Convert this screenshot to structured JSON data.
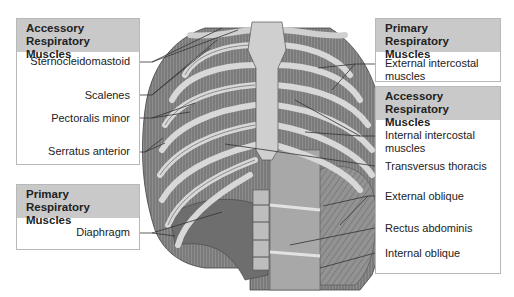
{
  "diagram": {
    "groups": [
      {
        "id": "left-accessory",
        "title": [
          "Accessory",
          "Respiratory Muscles"
        ],
        "labels": [
          "Sternocleidomastoid",
          "Scalenes",
          "Pectoralis minor",
          "Serratus anterior"
        ]
      },
      {
        "id": "left-primary",
        "title": [
          "Primary",
          "Respiratory Muscles"
        ],
        "labels": [
          "Diaphragm"
        ]
      },
      {
        "id": "right-primary",
        "title": [
          "Primary",
          "Respiratory Muscles"
        ],
        "labels": [
          [
            "External intercostal",
            "muscles"
          ]
        ]
      },
      {
        "id": "right-accessory",
        "title": [
          "Accessory",
          "Respiratory Muscles"
        ],
        "labels": [
          [
            "Internal intercostal",
            "muscles"
          ],
          "Transversus thoracis",
          "External oblique",
          "Rectus abdominis",
          "Internal oblique"
        ]
      }
    ],
    "colors": {
      "header": "#c9c9c9",
      "border": "#b8b8b8",
      "leader": "#333333",
      "bone": "#d6d6d6",
      "muscle": "#7a7a7a"
    }
  }
}
